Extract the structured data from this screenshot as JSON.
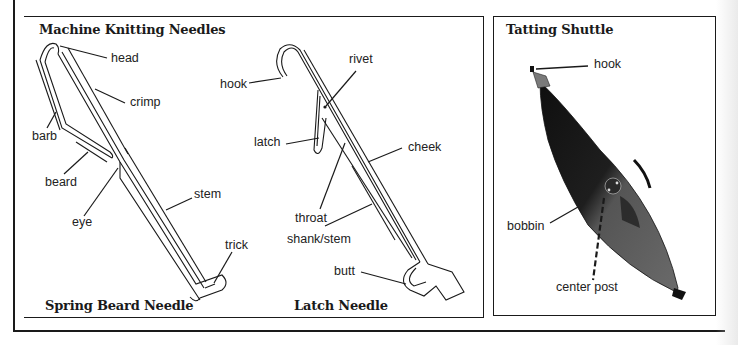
{
  "figure": {
    "panels": [
      {
        "id": "knitting",
        "title": "Machine Knitting Needles",
        "subfigures": [
          {
            "caption": "Spring Beard Needle",
            "labels": [
              "head",
              "crimp",
              "barb",
              "beard",
              "eye",
              "stem",
              "trick"
            ]
          },
          {
            "caption": "Latch Needle",
            "labels": [
              "hook",
              "rivet",
              "latch",
              "cheek",
              "throat",
              "shank/stem",
              "butt"
            ]
          }
        ]
      },
      {
        "id": "tatting",
        "title": "Tatting Shuttle",
        "labels": [
          "hook",
          "bobbin",
          "center post"
        ]
      }
    ]
  },
  "colors": {
    "ink": "#1a1a1a",
    "shuttle_dark": "#1c1c1c",
    "shuttle_mid": "#5a5a5a"
  }
}
